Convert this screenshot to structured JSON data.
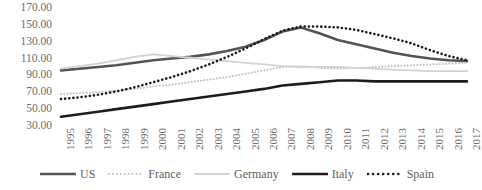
{
  "chart_data": {
    "type": "line",
    "title": "",
    "xlabel": "",
    "ylabel": "",
    "grid": false,
    "legend_position": "bottom",
    "ylim": [
      30,
      170
    ],
    "yticks": [
      "30.00",
      "50.00",
      "70.00",
      "90.00",
      "110.00",
      "130.00",
      "150.00",
      "170.00"
    ],
    "ytick_values": [
      30,
      50,
      70,
      90,
      110,
      130,
      150,
      170
    ],
    "categories": [
      "1995",
      "1996",
      "1997",
      "1998",
      "1999",
      "2000",
      "2001",
      "2002",
      "2003",
      "2004",
      "2005",
      "2006",
      "2007",
      "2008",
      "2009",
      "2010",
      "2011",
      "2012",
      "2013",
      "2014",
      "2015",
      "2016",
      "2017"
    ],
    "series": [
      {
        "name": "US",
        "color": "#545454",
        "style": "solid",
        "width": 2.6,
        "values": [
          96,
          98,
          100,
          102,
          105,
          108,
          110,
          112,
          115,
          119,
          124,
          132,
          142,
          147,
          140,
          132,
          127,
          122,
          117,
          113,
          110,
          108,
          107
        ]
      },
      {
        "name": "France",
        "color": "#c0c0c0",
        "style": "dotted",
        "width": 2.0,
        "values": [
          68,
          69,
          70,
          72,
          74,
          77,
          79,
          82,
          85,
          88,
          92,
          96,
          100,
          101,
          99,
          98,
          99,
          100,
          101,
          102,
          103,
          104,
          105
        ]
      },
      {
        "name": "Germany",
        "color": "#d2d2d2",
        "style": "solid",
        "width": 1.8,
        "values": [
          98,
          101,
          104,
          108,
          112,
          115,
          113,
          111,
          109,
          107,
          105,
          103,
          101,
          100,
          100,
          100,
          99,
          98,
          97,
          96,
          95,
          95,
          95
        ]
      },
      {
        "name": "Italy",
        "color": "#1c1c1c",
        "style": "solid",
        "width": 2.6,
        "values": [
          41,
          44,
          47,
          50,
          53,
          56,
          59,
          62,
          65,
          68,
          71,
          74,
          78,
          80,
          82,
          84,
          84,
          83,
          83,
          83,
          83,
          83,
          83
        ]
      },
      {
        "name": "Spain",
        "color": "#1c1c1c",
        "style": "dotted",
        "width": 2.6,
        "values": [
          62,
          64,
          67,
          71,
          76,
          82,
          88,
          95,
          103,
          112,
          122,
          133,
          143,
          148,
          148,
          147,
          144,
          139,
          134,
          128,
          120,
          113,
          108
        ]
      }
    ]
  },
  "legend": {
    "items": [
      {
        "label": "US"
      },
      {
        "label": "France"
      },
      {
        "label": "Germany"
      },
      {
        "label": "Italy"
      },
      {
        "label": "Spain"
      }
    ]
  }
}
